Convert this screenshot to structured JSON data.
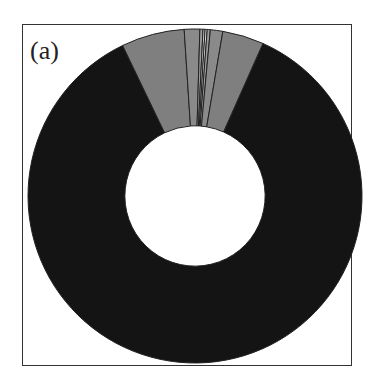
{
  "chart_data": {
    "type": "pie",
    "variant": "donut",
    "title": "",
    "panel_label": "(a)",
    "legend": "none",
    "slices": [
      {
        "name": "major",
        "value": 86.2,
        "color": "#141414"
      },
      {
        "name": "gray-left",
        "value": 6.1,
        "color": "#7f7f7f"
      },
      {
        "name": "gray-mid-left",
        "value": 1.5,
        "color": "#8a8a8a"
      },
      {
        "name": "sliver-1",
        "value": 0.3,
        "color": "#9a9a9a"
      },
      {
        "name": "sliver-2",
        "value": 0.2,
        "color": "#c8c8c8"
      },
      {
        "name": "sliver-3",
        "value": 0.2,
        "color": "#e0e0e0"
      },
      {
        "name": "sliver-4",
        "value": 0.3,
        "color": "#9a9a9a"
      },
      {
        "name": "gray-mid-right",
        "value": 1.2,
        "color": "#8a8a8a"
      },
      {
        "name": "gray-right",
        "value": 4.0,
        "color": "#7f7f7f"
      }
    ],
    "start_angle_deg": 24,
    "inner_radius_ratio": 0.42
  }
}
